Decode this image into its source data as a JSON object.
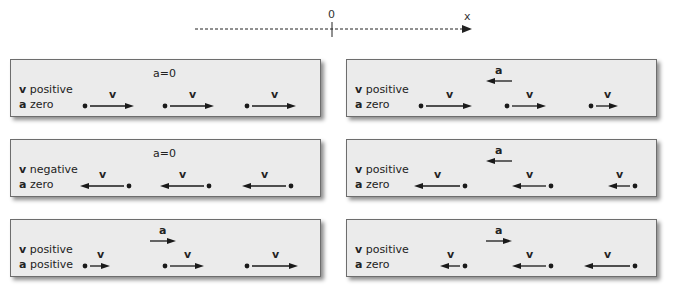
{
  "axis": {
    "origin_label": "0",
    "axis_label": "x",
    "style": "dashed",
    "direction": "right"
  },
  "panels": [
    {
      "id": "row1-left",
      "v_text": "v",
      "v_desc": "positive",
      "a_text": "a",
      "a_desc": "zero",
      "accel_indicator": {
        "type": "text",
        "label": "a=0"
      },
      "velocity_arrows": [
        {
          "label": "v",
          "direction": "right",
          "length": 44
        },
        {
          "label": "v",
          "direction": "right",
          "length": 44
        },
        {
          "label": "v",
          "direction": "right",
          "length": 44
        }
      ]
    },
    {
      "id": "row1-right",
      "v_text": "v",
      "v_desc": "positive",
      "a_text": "a",
      "a_desc": "zero",
      "accel_indicator": {
        "type": "arrow",
        "label": "a",
        "direction": "left"
      },
      "velocity_arrows": [
        {
          "label": "v",
          "direction": "right",
          "length": 46
        },
        {
          "label": "v",
          "direction": "right",
          "length": 34
        },
        {
          "label": "v",
          "direction": "right",
          "length": 22
        }
      ]
    },
    {
      "id": "row2-left",
      "v_text": "v",
      "v_desc": "negative",
      "a_text": "a",
      "a_desc": "zero",
      "accel_indicator": {
        "type": "text",
        "label": "a=0"
      },
      "velocity_arrows": [
        {
          "label": "v",
          "direction": "left",
          "length": 44
        },
        {
          "label": "v",
          "direction": "left",
          "length": 44
        },
        {
          "label": "v",
          "direction": "left",
          "length": 44
        }
      ]
    },
    {
      "id": "row2-right",
      "v_text": "v",
      "v_desc": "positive",
      "a_text": "a",
      "a_desc": "zero",
      "accel_indicator": {
        "type": "arrow",
        "label": "a",
        "direction": "left"
      },
      "velocity_arrows": [
        {
          "label": "v",
          "direction": "left",
          "length": 46
        },
        {
          "label": "v",
          "direction": "left",
          "length": 34
        },
        {
          "label": "v",
          "direction": "left",
          "length": 22
        }
      ]
    },
    {
      "id": "row3-left",
      "v_text": "v",
      "v_desc": "positive",
      "a_text": "a",
      "a_desc": "positive",
      "accel_indicator": {
        "type": "arrow",
        "label": "a",
        "direction": "right"
      },
      "velocity_arrows": [
        {
          "label": "v",
          "direction": "right",
          "length": 20
        },
        {
          "label": "v",
          "direction": "right",
          "length": 34
        },
        {
          "label": "v",
          "direction": "right",
          "length": 46
        }
      ]
    },
    {
      "id": "row3-right",
      "v_text": "v",
      "v_desc": "positive",
      "a_text": "a",
      "a_desc": "zero",
      "accel_indicator": {
        "type": "arrow",
        "label": "a",
        "direction": "right"
      },
      "velocity_arrows": [
        {
          "label": "v",
          "direction": "left",
          "length": 20
        },
        {
          "label": "v",
          "direction": "left",
          "length": 34
        },
        {
          "label": "v",
          "direction": "left",
          "length": 46
        }
      ]
    }
  ],
  "colors": {
    "panel_fill": "#ebebeb",
    "panel_border": "#6d6d6d",
    "arrow": "#1a1a1a"
  }
}
